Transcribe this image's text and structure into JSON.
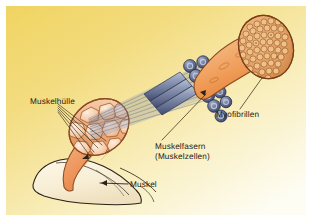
{
  "figure": {
    "type": "anatomical-diagram",
    "subject": "Muskel",
    "language": "de"
  },
  "canvas": {
    "width": 312,
    "height": 221,
    "outer_background": "#ffffff",
    "plate_bounds": {
      "x": 6,
      "y": 6,
      "width": 300,
      "height": 209
    },
    "background_gradient": {
      "from": "#f2d76a",
      "mid": "#f5e08d",
      "to": "#fdfbec",
      "direction": "top-left to bottom-right"
    }
  },
  "labels": {
    "muskelhuelle": "Muskelhülle",
    "myofibrillen": "Myofibrillen",
    "muskelfasern_line1": "Muskelfasern",
    "muskelfasern_line2": "(Muskelzellen)",
    "muskel": "Muskel"
  },
  "structures": [
    {
      "id": "bone",
      "label": "Knochen",
      "fill": "#fbf4df",
      "stroke": "#2a2217",
      "description": "pale cream bone with tendon at lower left"
    },
    {
      "id": "muscle-belly",
      "label": "Muskel",
      "fill": "#f0a272",
      "stroke": "#8a4a22",
      "description": "orange tapering muscle belly with cut cross-section"
    },
    {
      "id": "fascicle-cross-section",
      "label": "Muskelfaserbündel",
      "fill": "#f6cfae",
      "stroke": "#8a4a22",
      "count": 13,
      "description": "polygonal fascicles inside cut muscle face"
    },
    {
      "id": "fiber-bundle",
      "label": "Muskelfasern (Muskelzellen)",
      "fill": "#7c88a8",
      "stroke": "#2b3350",
      "count": 11,
      "description": "blue-grey bundle of muscle fibres magnified from the muscle"
    },
    {
      "id": "muscle-fiber",
      "label": "Muskelfaser",
      "fill": "#f0a05f",
      "stroke": "#8a4a22",
      "description": "single orange muscle fibre cylinder, upper right"
    },
    {
      "id": "myofibril-cross-section",
      "label": "Myofibrillen",
      "fill": "#e8a86a",
      "stroke": "#7a3f18",
      "count": 52,
      "description": "dense packed myofibril circles on the cut end of the fibre"
    }
  ],
  "leader_lines": [
    {
      "from": "muskelhuelle",
      "to": "muscle-sheath",
      "style": "fan"
    },
    {
      "from": "myofibrillen",
      "to": "myofibril-cross-section",
      "style": "single"
    },
    {
      "from": "muskelfasern",
      "to": "fiber-bundle",
      "style": "single"
    },
    {
      "from": "muskel",
      "to": "muscle-belly",
      "style": "single"
    }
  ],
  "colors": {
    "ink": "#1d1b16",
    "leader": "#2a2217",
    "muscle_orange": "#f0a272",
    "muscle_orange_dark": "#d9763c",
    "fiber_blue": "#7c88a8",
    "fiber_blue_dark": "#2b3350",
    "bone_cream": "#fbf4df",
    "plate_yellow": "#f2d76a"
  }
}
